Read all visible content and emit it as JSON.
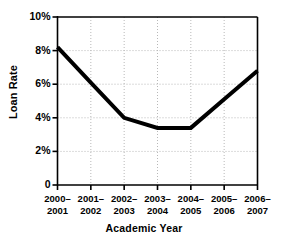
{
  "chart_data": {
    "type": "line",
    "title": "",
    "xlabel": "Academic Year",
    "ylabel": "Loan Rate",
    "categories": [
      "2000–2001",
      "2001–2002",
      "2002–2003",
      "2003–2004",
      "2004–2005",
      "2005–2006",
      "2006–2007"
    ],
    "category_lines": [
      [
        "2000–",
        "2001"
      ],
      [
        "2001–",
        "2002"
      ],
      [
        "2002–",
        "2003"
      ],
      [
        "2003–",
        "2004"
      ],
      [
        "2004–",
        "2005"
      ],
      [
        "2005–",
        "2006"
      ],
      [
        "2006–",
        "2007"
      ]
    ],
    "values": [
      8.2,
      6.1,
      4.0,
      3.4,
      3.4,
      5.1,
      6.8
    ],
    "ylim": [
      0,
      10
    ],
    "yticks": [
      0,
      2,
      4,
      6,
      8,
      10
    ],
    "ytick_labels": [
      "0",
      "2%",
      "4%",
      "6%",
      "8%",
      "10%"
    ],
    "grid": true,
    "grid_style": "dotted",
    "legend": "none",
    "line_color": "#000000",
    "line_width": 4,
    "axis_color": "#000000",
    "grid_color": "#b8b8b8",
    "background": "#ffffff"
  },
  "axes": {
    "y_title": "Loan Rate",
    "x_title": "Academic Year"
  }
}
